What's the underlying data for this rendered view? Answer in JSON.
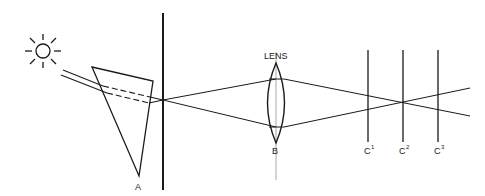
{
  "diagram": {
    "type": "optics-spectroscope",
    "components": {
      "light_source": {
        "label": "",
        "icon": "sun-icon"
      },
      "prism": {
        "label": "A"
      },
      "slit": {
        "label": ""
      },
      "lens": {
        "label_top": "LENS",
        "label_bottom": "B"
      },
      "screens": [
        {
          "label": "C",
          "superscript": "1"
        },
        {
          "label": "C",
          "superscript": "2"
        },
        {
          "label": "C",
          "superscript": "3"
        }
      ]
    },
    "colors": {
      "stroke": "#1a1a1a",
      "background": "#ffffff",
      "axis": "#888888"
    }
  }
}
